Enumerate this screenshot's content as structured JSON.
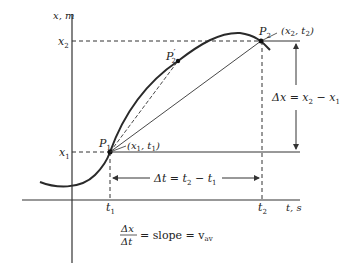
{
  "diagram": {
    "axes": {
      "y_label": "x, m",
      "x_label": "t, s"
    },
    "ticks": {
      "x1": "x",
      "x1_sub": "1",
      "x2": "x",
      "x2_sub": "2",
      "t1": "t",
      "t1_sub": "1",
      "t2": "t",
      "t2_sub": "2"
    },
    "points": {
      "p1": {
        "name": "P",
        "sub": "1",
        "coord": "(x",
        "coord_sub1": "1",
        "coord_mid": ", t",
        "coord_sub2": "1",
        "coord_end": ")"
      },
      "p2": {
        "name": "P",
        "sub": "2",
        "coord": "(x",
        "coord_sub1": "2",
        "coord_mid": ", t",
        "coord_sub2": "2",
        "coord_end": ")"
      },
      "p2prime": {
        "name": "P",
        "sub": "2",
        "prime": "′"
      }
    },
    "annotations": {
      "delta_x": {
        "lhs": "Δx = x",
        "sub1": "2",
        "mid": " − x",
        "sub2": "1"
      },
      "delta_t": {
        "lhs": "Δt = t",
        "sub1": "2",
        "mid": " − t",
        "sub2": "1"
      },
      "formula": {
        "num": "Δx",
        "den": "Δt",
        "rhs": "= slope = v",
        "rhs_sub": "av"
      }
    },
    "colors": {
      "line": "#333333",
      "curve": "#2a2a2a",
      "background": "#ffffff"
    }
  }
}
